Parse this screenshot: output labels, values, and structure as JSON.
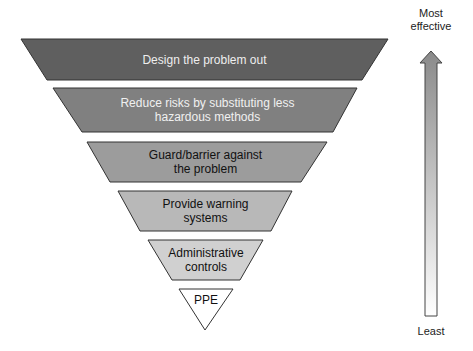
{
  "levels": [
    {
      "label": "Design the problem out",
      "fill": "#5f5f5f",
      "text_color": "#eeeeee"
    },
    {
      "label": "Reduce risks by substituting less hazardous methods",
      "line1": "Reduce risks by substituting less",
      "line2": "hazardous methods",
      "fill": "#808080",
      "text_color": "#f0f0f0"
    },
    {
      "label": "Guard/barrier against the problem",
      "line1": "Guard/barrier against",
      "line2": "the problem",
      "fill": "#9c9c9c",
      "text_color": "#111111"
    },
    {
      "label": "Provide warning systems",
      "line1": "Provide warning",
      "line2": "systems",
      "fill": "#b8b8b8",
      "text_color": "#111111"
    },
    {
      "label": "Administrative controls",
      "line1": "Administrative",
      "line2": "controls",
      "fill": "#d0d0d0",
      "text_color": "#111111"
    },
    {
      "label": "PPE",
      "fill": "#ffffff",
      "text_color": "#111111"
    }
  ],
  "scale": {
    "top_label_line1": "Most",
    "top_label_line2": "effective",
    "bottom_label": "Least",
    "arrow_top_color": "#8a8a8a",
    "arrow_bottom_color": "#ffffff"
  }
}
